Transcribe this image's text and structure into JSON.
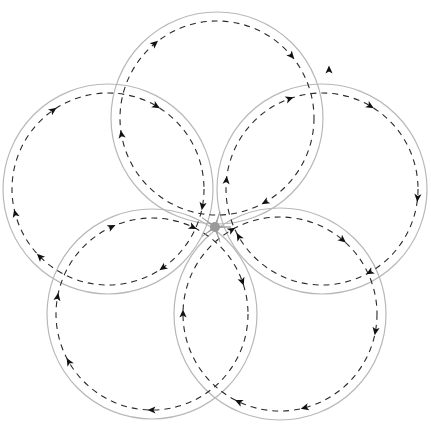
{
  "diagram": {
    "title": "",
    "width": 431,
    "height": 428,
    "colors": {
      "background": "#ffffff",
      "outer_circle": "#b8b8b8",
      "dashed_path": "#2a2a2a",
      "arrow": "#111111",
      "star": "#9a9a9a"
    },
    "star_center": [
      215,
      227
    ],
    "circles": [
      {
        "id": "top",
        "cx": 217,
        "cy": 118,
        "r": 106,
        "inner_r": 97,
        "direction": "clockwise",
        "arrows_deg": [
          -130,
          -40,
          60,
          170
        ]
      },
      {
        "id": "left",
        "cx": 108,
        "cy": 189,
        "r": 105,
        "inner_r": 96,
        "direction": "clockwise",
        "arrows_deg": [
          -125,
          -60,
          10,
          55,
          135,
          165
        ]
      },
      {
        "id": "right",
        "cx": 322,
        "cy": 189,
        "r": 105,
        "inner_r": 96,
        "direction": "clockwise",
        "arrows_deg": [
          -110,
          -60,
          5,
          60,
          150,
          185
        ]
      },
      {
        "id": "bottom-left",
        "cx": 152,
        "cy": 314,
        "r": 105,
        "inner_r": 96,
        "direction": "clockwise",
        "arrows_deg": [
          -115,
          -65,
          -20,
          90,
          150,
          190
        ]
      },
      {
        "id": "bottom-right",
        "cx": 280,
        "cy": 314,
        "r": 106,
        "inner_r": 97,
        "direction": "clockwise",
        "arrows_deg": [
          -120,
          -50,
          10,
          75,
          115,
          180
        ]
      }
    ],
    "stray_arrow": {
      "x": 329,
      "y": 70,
      "angle": -90
    }
  }
}
